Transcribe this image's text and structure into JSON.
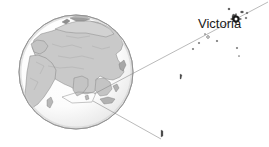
{
  "figure": {
    "type": "locator-map",
    "background_color": "#ffffff",
    "width": 269,
    "height": 147
  },
  "globe": {
    "name": "globe",
    "center_x": 76,
    "center_y": 72,
    "radius": 57,
    "ocean_color": "#ffffff",
    "land_color": "#c9c9c9",
    "outline_color": "#8a8a8a",
    "coastline_color": "#6e6e6e",
    "shadow_color": "#d8d8d8",
    "projection": "orthographic",
    "centered_on": "Asia / Indian Ocean"
  },
  "callout": {
    "name": "callout-lines",
    "line_color": "#8c8c8c",
    "line_width": 0.6,
    "origin_label": "Seychelles location on globe",
    "upper_line": {
      "x1": 95,
      "y1": 95,
      "x2": 268,
      "y2": 2
    },
    "lower_line": {
      "x1": 95,
      "y1": 100,
      "x2": 161,
      "y2": 139
    },
    "anchor_box": {
      "x": 62,
      "y": 93,
      "w": 34,
      "h": 10
    }
  },
  "inset": {
    "name": "seychelles-inset",
    "region": "Seychelles",
    "island_color": "#4a4a4a",
    "island_outline": "#666666",
    "islands": [
      {
        "name": "mahe",
        "x": 232,
        "y": 16,
        "w": 4,
        "h": 6
      },
      {
        "name": "praslin",
        "x": 241,
        "y": 11,
        "w": 3,
        "h": 2
      },
      {
        "name": "la-digue",
        "x": 246,
        "y": 12,
        "w": 2,
        "h": 2
      },
      {
        "name": "silhouette",
        "x": 228,
        "y": 8,
        "w": 2,
        "h": 2
      },
      {
        "name": "curieuse",
        "x": 245,
        "y": 17,
        "w": 2,
        "h": 2
      },
      {
        "name": "north-island",
        "x": 236,
        "y": 20,
        "w": 2,
        "h": 2
      },
      {
        "name": "fregate",
        "x": 216,
        "y": 40,
        "w": 2,
        "h": 2
      },
      {
        "name": "bird-island",
        "x": 198,
        "y": 42,
        "w": 2,
        "h": 2
      },
      {
        "name": "denis-island",
        "x": 192,
        "y": 48,
        "w": 2,
        "h": 2
      },
      {
        "name": "aride",
        "x": 207,
        "y": 36,
        "w": 2,
        "h": 2
      },
      {
        "name": "cousin",
        "x": 236,
        "y": 47,
        "w": 2,
        "h": 2
      },
      {
        "name": "platte",
        "x": 180,
        "y": 75,
        "w": 2,
        "h": 4
      },
      {
        "name": "coetivy",
        "x": 161,
        "y": 129,
        "w": 3,
        "h": 6
      },
      {
        "name": "alphonse",
        "x": 238,
        "y": 55,
        "w": 1,
        "h": 1
      },
      {
        "name": "desroches",
        "x": 204,
        "y": 33,
        "w": 1,
        "h": 1
      }
    ]
  },
  "city": {
    "name": "Victoria",
    "label": "Victoria",
    "label_color": "#1a1a1a",
    "label_x": 198,
    "label_y": 17,
    "marker": {
      "name": "capital-city-marker",
      "type": "capital-star",
      "x": 236,
      "y": 19,
      "color": "#1a1a1a",
      "radius": 4
    }
  }
}
